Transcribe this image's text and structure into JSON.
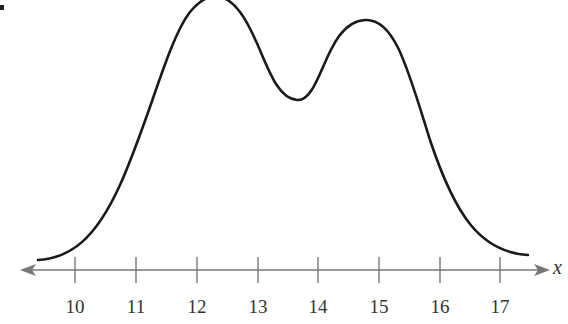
{
  "chart_data": {
    "type": "line",
    "title": "",
    "subtitle": "",
    "xlabel": "x",
    "ylabel": "",
    "xlim": [
      9.4,
      18.0
    ],
    "x_ticks": [
      10,
      11,
      12,
      13,
      14,
      15,
      16,
      17
    ],
    "x_tick_labels": [
      "10",
      "11",
      "12",
      "13",
      "14",
      "15",
      "16",
      "17"
    ],
    "y_axis_shown": false,
    "grid": false,
    "legend": null,
    "series": [
      {
        "name": "curve",
        "x": [
          9.6,
          10.0,
          10.5,
          11.0,
          11.5,
          12.0,
          12.3,
          12.6,
          13.0,
          13.3,
          13.6,
          13.9,
          14.2,
          14.5,
          14.8,
          15.1,
          15.5,
          16.0,
          16.5,
          17.0,
          17.5
        ],
        "y": [
          0.04,
          0.07,
          0.17,
          0.38,
          0.68,
          0.93,
          1.0,
          0.97,
          0.8,
          0.68,
          0.64,
          0.68,
          0.81,
          0.9,
          0.93,
          0.89,
          0.72,
          0.42,
          0.18,
          0.07,
          0.05
        ],
        "y_units": "relative height (peak = 1)"
      }
    ],
    "peaks": [
      {
        "x": 12.3,
        "relative_height": 1.0
      },
      {
        "x": 14.8,
        "relative_height": 0.93
      }
    ],
    "trough": {
      "x": 13.6,
      "relative_height": 0.64
    }
  },
  "axis": {
    "variable_label": "x",
    "ticks": [
      {
        "value": "10",
        "px": 75
      },
      {
        "value": "11",
        "px": 136
      },
      {
        "value": "12",
        "px": 197
      },
      {
        "value": "13",
        "px": 258
      },
      {
        "value": "14",
        "px": 318
      },
      {
        "value": "15",
        "px": 379
      },
      {
        "value": "16",
        "px": 440
      },
      {
        "value": "17",
        "px": 500
      }
    ]
  },
  "colors": {
    "curve": "#1a1a1a",
    "axis": "#777777",
    "label": "#333333"
  }
}
